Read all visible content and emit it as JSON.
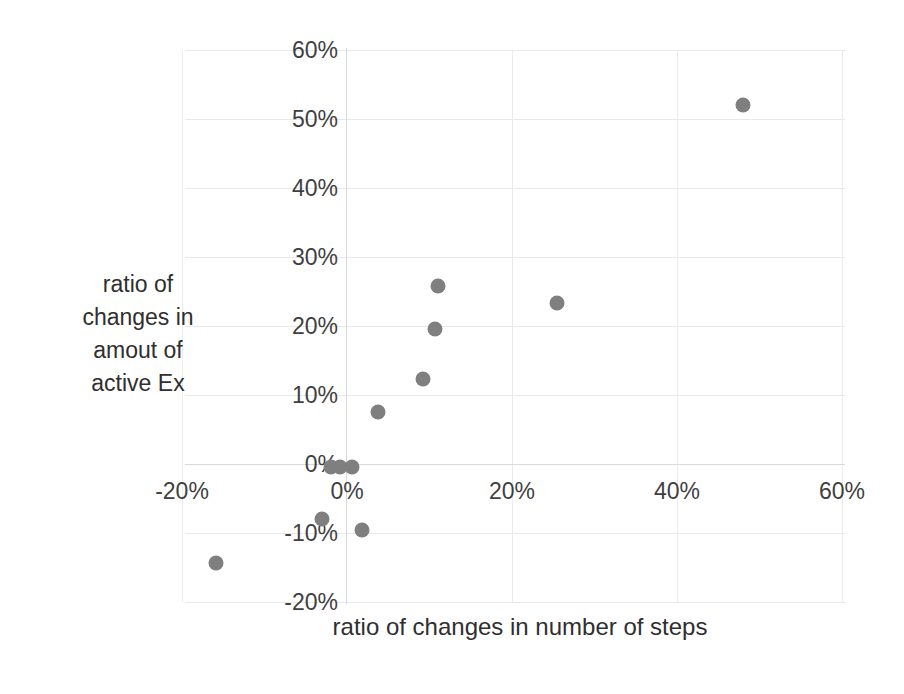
{
  "chart_data": {
    "type": "scatter",
    "title": "",
    "xlabel": "ratio of changes in number of steps",
    "ylabel": "ratio of changes in amout of active Ex",
    "xlim": [
      -30,
      65
    ],
    "ylim": [
      -20,
      60
    ],
    "xticks": [
      "-20%",
      "0%",
      "20%",
      "40%",
      "60%"
    ],
    "xtick_values": [
      -20,
      0,
      20,
      40,
      60
    ],
    "yticks": [
      "60%",
      "50%",
      "40%",
      "30%",
      "20%",
      "10%",
      "0%",
      "-10%",
      "-20%"
    ],
    "ytick_values": [
      60,
      50,
      40,
      30,
      20,
      10,
      0,
      -10,
      -20
    ],
    "grid": true,
    "legend": "none",
    "marker_color": "#7f7f7f",
    "points": [
      {
        "label": "point-1",
        "x": 48.0,
        "y": 52.0
      },
      {
        "label": "point-2",
        "x": 25.5,
        "y": 23.3
      },
      {
        "label": "point-3",
        "x": 11.0,
        "y": 25.8
      },
      {
        "label": "point-4",
        "x": 10.7,
        "y": 19.5
      },
      {
        "label": "point-5",
        "x": 9.2,
        "y": 12.3
      },
      {
        "label": "point-6",
        "x": 3.8,
        "y": 7.5
      },
      {
        "label": "point-7",
        "x": -2.0,
        "y": -0.4
      },
      {
        "label": "point-8",
        "x": -0.8,
        "y": -0.4
      },
      {
        "label": "point-9",
        "x": 0.6,
        "y": -0.4
      },
      {
        "label": "point-10",
        "x": -3.0,
        "y": -8.0
      },
      {
        "label": "point-11",
        "x": 1.8,
        "y": -9.6
      },
      {
        "label": "point-12",
        "x": -15.9,
        "y": -14.4
      }
    ]
  },
  "axes": {
    "y_title_lines": [
      "ratio of",
      "changes in",
      "amout of",
      "active Ex"
    ],
    "y_title": "ratio of changes in amout of active Ex",
    "x_title": "ratio of changes in number of steps"
  }
}
